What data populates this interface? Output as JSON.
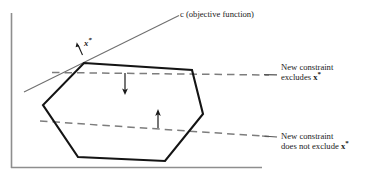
{
  "figure": {
    "axes": {
      "vertical_axis": "y-axis",
      "horizontal_axis": "x-axis",
      "color": "#8c8c8c"
    },
    "objective_line": {
      "name": "objective-function-line",
      "label": "c (objective function)",
      "color": "#6b6b6b"
    },
    "optimum_point": {
      "name": "optimal-vertex",
      "label_x": "x",
      "label_star": "*"
    },
    "feasible_region": {
      "name": "feasible-polygon",
      "color": "#111111",
      "vertices": [
        [
          84,
          63
        ],
        [
          192,
          70
        ],
        [
          203,
          114
        ],
        [
          165,
          161
        ],
        [
          78,
          157
        ],
        [
          43,
          105
        ]
      ]
    },
    "constraints": [
      {
        "name": "new-constraint-excludes",
        "line_label_1": "New constraint",
        "line_label_2_prefix": "excludes ",
        "line_label_2_var": "x",
        "line_label_2_star": "*",
        "dash_color": "#7a7a7a",
        "arrow_direction": "down"
      },
      {
        "name": "new-constraint-does-not-exclude",
        "line_label_1": "New constraint",
        "line_label_2_prefix": "does not exclude ",
        "line_label_2_var": "x",
        "line_label_2_star": "*",
        "dash_color": "#7a7a7a",
        "arrow_direction": "up"
      }
    ]
  }
}
